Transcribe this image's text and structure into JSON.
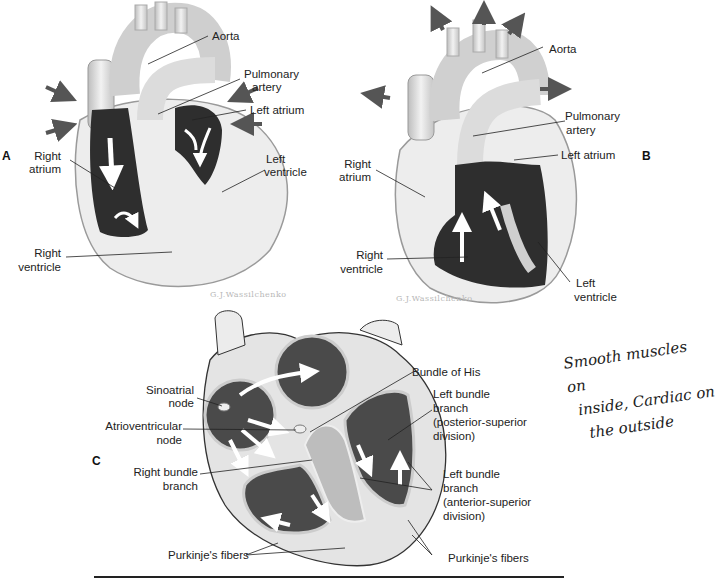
{
  "figure": {
    "panels": [
      {
        "id": "A",
        "letter": "A",
        "labels": {
          "aorta": "Aorta",
          "pulmonary_artery_1": "Pulmonary",
          "pulmonary_artery_2": "artery",
          "left_atrium": "Left atrium",
          "right_atrium_1": "Right",
          "right_atrium_2": "atrium",
          "left_ventricle_1": "Left",
          "left_ventricle_2": "ventricle",
          "right_ventricle_1": "Right",
          "right_ventricle_2": "ventricle"
        },
        "credit": "G.J.Wassilchenko"
      },
      {
        "id": "B",
        "letter": "B",
        "labels": {
          "aorta": "Aorta",
          "pulmonary_artery_1": "Pulmonary",
          "pulmonary_artery_2": "artery",
          "left_atrium": "Left atrium",
          "right_atrium_1": "Right",
          "right_atrium_2": "atrium",
          "right_ventricle_1": "Right",
          "right_ventricle_2": "ventricle",
          "left_ventricle_1": "Left",
          "left_ventricle_2": "ventricle"
        },
        "credit": "G.J.Wassilchenko"
      },
      {
        "id": "C",
        "letter": "C",
        "labels": {
          "bundle_of_his": "Bundle of His",
          "sa_node_1": "Sinoatrial",
          "sa_node_2": "node",
          "av_node_1": "Atrioventricular",
          "av_node_2": "node",
          "right_bundle_1": "Right bundle",
          "right_bundle_2": "branch",
          "lbb_post_1": "Left bundle",
          "lbb_post_2": "branch",
          "lbb_post_3": "(posterior-superior",
          "lbb_post_4": "division)",
          "lbb_ant_1": "Left bundle",
          "lbb_ant_2": "branch",
          "lbb_ant_3": "(anterior-superior",
          "lbb_ant_4": "division)",
          "purkinje_left": "Purkinje's fibers",
          "purkinje_right": "Purkinje's fibers"
        }
      }
    ],
    "handwritten_note": {
      "line1": "Smooth muscles on",
      "line2": "inside, Cardiac on",
      "line3": "the outside"
    },
    "colors": {
      "chamber_dark": "#2e2e2e",
      "chamber_gray": "#4a4a4a",
      "tissue_light": "#e6e6e6",
      "vessel": "#d4d4d4",
      "arrow": "#444444"
    }
  }
}
